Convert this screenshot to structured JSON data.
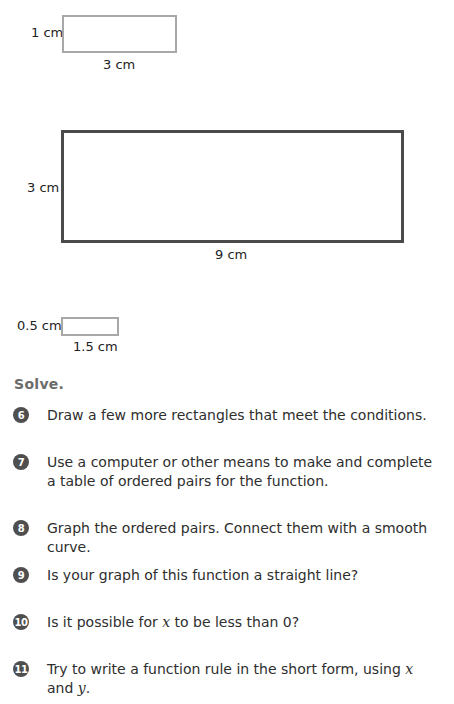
{
  "diagrams": [
    {
      "height_label": "1 cm",
      "width_label": "3 cm",
      "style": "light"
    },
    {
      "height_label": "3 cm",
      "width_label": "9 cm",
      "style": "dark"
    },
    {
      "height_label": "0.5 cm",
      "width_label": "1.5 cm",
      "style": "light"
    }
  ],
  "section": {
    "title": "Solve."
  },
  "questions": [
    {
      "number": "6",
      "text": "Draw a few more rectangles that meet the conditions."
    },
    {
      "number": "7",
      "text": "Use a computer or other means to make and complete a table of ordered pairs for the function."
    },
    {
      "number": "8",
      "text": "Graph the ordered pairs. Connect them with a smooth curve."
    },
    {
      "number": "9",
      "text": "Is your graph of this function a straight line?"
    },
    {
      "number": "10",
      "text_before": "Is it possible for ",
      "var1": "x",
      "text_after": " to be less than 0?"
    },
    {
      "number": "11",
      "text_before": "Try to write a function rule in the short form, using ",
      "var1": "x",
      "text_mid": " and ",
      "var2": "y",
      "text_after": "."
    }
  ],
  "colors": {
    "light_border": "#a8a8a8",
    "dark_border": "#4a4a4a",
    "badge": "#4f4f4f",
    "heading": "#6b6b6b"
  }
}
